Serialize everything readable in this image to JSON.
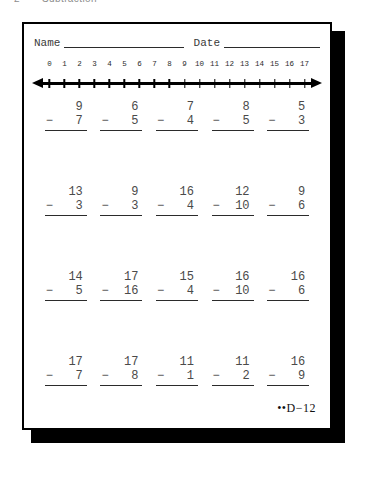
{
  "page_header": {
    "number": "2",
    "title": "Subtraction"
  },
  "worksheet": {
    "name_label": "Name",
    "date_label": "Date",
    "footer_code": "••D−12"
  },
  "number_line": {
    "ticks": [
      "0",
      "1",
      "2",
      "3",
      "4",
      "5",
      "6",
      "7",
      "8",
      "9",
      "10",
      "11",
      "12",
      "13",
      "14",
      "15",
      "16",
      "17"
    ],
    "min": 0,
    "max": 17,
    "left_arrow": true,
    "right_arrow": true
  },
  "problems": {
    "operator": "−",
    "rows": [
      [
        {
          "minuend": "9",
          "subtrahend": "7"
        },
        {
          "minuend": "6",
          "subtrahend": "5"
        },
        {
          "minuend": "7",
          "subtrahend": "4"
        },
        {
          "minuend": "8",
          "subtrahend": "5"
        },
        {
          "minuend": "5",
          "subtrahend": "3"
        }
      ],
      [
        {
          "minuend": "13",
          "subtrahend": "3"
        },
        {
          "minuend": "9",
          "subtrahend": "3"
        },
        {
          "minuend": "16",
          "subtrahend": "4"
        },
        {
          "minuend": "12",
          "subtrahend": "10"
        },
        {
          "minuend": "9",
          "subtrahend": "6"
        }
      ],
      [
        {
          "minuend": "14",
          "subtrahend": "5"
        },
        {
          "minuend": "17",
          "subtrahend": "16"
        },
        {
          "minuend": "15",
          "subtrahend": "4"
        },
        {
          "minuend": "16",
          "subtrahend": "10"
        },
        {
          "minuend": "16",
          "subtrahend": "6"
        }
      ],
      [
        {
          "minuend": "17",
          "subtrahend": "7"
        },
        {
          "minuend": "17",
          "subtrahend": "8"
        },
        {
          "minuend": "11",
          "subtrahend": "1"
        },
        {
          "minuend": "11",
          "subtrahend": "2"
        },
        {
          "minuend": "16",
          "subtrahend": "9"
        }
      ]
    ]
  },
  "colors": {
    "ink": "#2b2b2b",
    "print_gray": "#4a4a4a",
    "border": "#000000",
    "shadow": "#000000",
    "paper": "#ffffff"
  }
}
